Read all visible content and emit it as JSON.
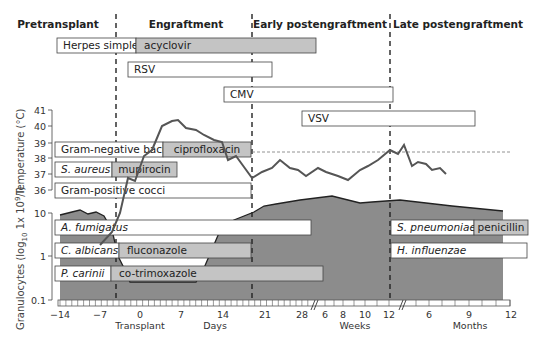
{
  "phases": [
    {
      "label": "Pretransplant",
      "x": 58
    },
    {
      "label": "Engraftment",
      "x": 186
    },
    {
      "label": "Early postengraftment",
      "x": 320
    },
    {
      "label": "Late postengraftment",
      "x": 458
    }
  ],
  "phase_dividers_x": [
    116,
    252,
    390
  ],
  "bars": [
    {
      "id": "herpes-simplex",
      "label": "Herpes simplex",
      "italic": false,
      "x": 57,
      "y": 38,
      "w": 79,
      "h": 15,
      "drug": "acyclovir",
      "drug_w": 180
    },
    {
      "id": "rsv",
      "label": "RSV",
      "italic": false,
      "x": 128,
      "y": 62,
      "w": 144,
      "h": 15
    },
    {
      "id": "cmv",
      "label": "CMV",
      "italic": false,
      "x": 224,
      "y": 87,
      "w": 169,
      "h": 15
    },
    {
      "id": "vsv",
      "label": "VSV",
      "italic": false,
      "x": 302,
      "y": 111,
      "w": 173,
      "h": 15
    },
    {
      "id": "gram-negative-bacilli",
      "label": "Gram-negative bacilli",
      "italic": false,
      "x": 55,
      "y": 142,
      "w": 108,
      "h": 15,
      "drug": "ciprofloxacin",
      "drug_w": 88
    },
    {
      "id": "s-aureus",
      "label": "S. aureus",
      "italic": true,
      "x": 55,
      "y": 162,
      "w": 57,
      "h": 15,
      "drug": "mupirocin",
      "drug_w": 65
    },
    {
      "id": "gram-positive-cocci",
      "label": "Gram-positive cocci",
      "italic": false,
      "x": 55,
      "y": 183,
      "w": 196,
      "h": 15
    },
    {
      "id": "a-fumigatus",
      "label": "A. fumigatus",
      "italic": true,
      "x": 55,
      "y": 220,
      "w": 256,
      "h": 15
    },
    {
      "id": "c-albicans",
      "label": "C. albicans",
      "italic": true,
      "x": 55,
      "y": 243,
      "w": 64,
      "h": 15,
      "drug": "fluconazole",
      "drug_w": 132
    },
    {
      "id": "p-carinii",
      "label": "P. carinii",
      "italic": true,
      "x": 55,
      "y": 266,
      "w": 56,
      "h": 15,
      "drug": "co-trimoxazole",
      "drug_w": 212
    },
    {
      "id": "s-pneumoniae",
      "label": "S. pneumoniae",
      "italic": true,
      "x": 391,
      "y": 220,
      "w": 83,
      "h": 15,
      "drug": "penicillin",
      "drug_w": 54
    },
    {
      "id": "h-influenzae",
      "label": "H. influenzae",
      "italic": true,
      "x": 391,
      "y": 243,
      "w": 136,
      "h": 15
    }
  ],
  "chart_data": {
    "type": "timeline",
    "title": "",
    "phases": [
      "Pretransplant",
      "Engraftment",
      "Early postengraftment",
      "Late postengraftment"
    ],
    "x_axis": {
      "segments": [
        {
          "unit": "Days",
          "ticks": [
            "-14",
            "-7",
            "0",
            "7",
            "14",
            "21",
            "28"
          ]
        },
        {
          "unit": "Weeks",
          "ticks": [
            "6",
            "8",
            "10",
            "12"
          ]
        },
        {
          "unit": "Months",
          "ticks": [
            "6",
            "9",
            "12"
          ]
        }
      ],
      "annotation": "Transplant",
      "annotation_at": "0"
    },
    "temperature": {
      "ylabel": "Temperature (°C)",
      "yticks": [
        "41",
        "40",
        "39",
        "38",
        "37",
        "36"
      ],
      "threshold": 38.5,
      "points_svg": "100,245 112,232 120,213 128,178 135,181 144,156 152,150 162,126 172,121 178,120 186,128 196,130 204,135 214,140 222,142 228,160 236,156 244,167 252,178 262,172 272,168 280,160 290,168 298,170 306,176 318,168 326,172 338,176 348,180 360,170 368,166 378,160 390,150 398,154 404,145 412,166 418,162 426,164 432,170 440,168 446,174"
    },
    "granulocytes": {
      "ylabel": "Granulocytes (log10 1x 10^9/l)",
      "yticks": [
        "10",
        "1",
        "0.1"
      ],
      "area_svg": "60,300 60,215 72,212 80,210 88,214 96,212 104,216 112,230 118,256 124,268 130,282 196,282 204,268 210,254 216,240 222,226 234,220 254,212 264,206 276,204 300,200 332,196 360,203 372,202 400,200 452,206 503,211 503,300"
    }
  },
  "axis": {
    "temp_label": "Temperature (°C)",
    "gran_label": "Granulocytes (log",
    "gran_sub": "10",
    "gran_rest": " 1x 10",
    "gran_sup": "9",
    "gran_tail": "/l)",
    "temp_ticks": [
      {
        "v": "41",
        "y": 110
      },
      {
        "v": "40",
        "y": 126
      },
      {
        "v": "39",
        "y": 143
      },
      {
        "v": "38",
        "y": 158
      },
      {
        "v": "37",
        "y": 174
      },
      {
        "v": "36",
        "y": 190
      }
    ],
    "gran_ticks": [
      {
        "v": "10",
        "y": 213
      },
      {
        "v": "1",
        "y": 256
      },
      {
        "v": "0.1",
        "y": 300
      }
    ],
    "x_ticks": [
      {
        "v": "−14",
        "x": 60
      },
      {
        "v": "−7",
        "x": 100
      },
      {
        "v": "0",
        "x": 140
      },
      {
        "v": "7",
        "x": 181
      },
      {
        "v": "14",
        "x": 223
      },
      {
        "v": "21",
        "x": 265
      },
      {
        "v": "28",
        "x": 302
      },
      {
        "v": "6",
        "x": 325
      },
      {
        "v": "8",
        "x": 343
      },
      {
        "v": "10",
        "x": 365
      },
      {
        "v": "12",
        "x": 389
      },
      {
        "v": "6",
        "x": 429
      },
      {
        "v": "9",
        "x": 469
      },
      {
        "v": "12",
        "x": 511
      }
    ],
    "transplant_label": "Transplant",
    "days_label": "Days",
    "weeks_label": "Weeks",
    "months_label": "Months"
  },
  "colors": {
    "bar_fill": "#ffffff",
    "drug_fill": "#c4c4c4",
    "area_fill": "#8a8a8a",
    "line": "#555555",
    "stroke": "#444444"
  }
}
